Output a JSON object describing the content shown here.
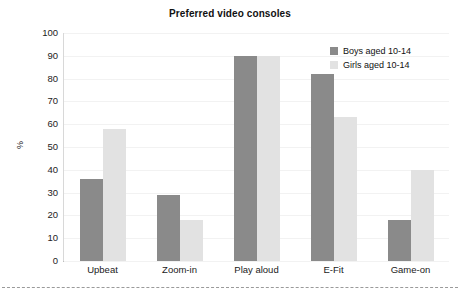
{
  "chart_data": {
    "type": "bar",
    "title": "Preferred video consoles",
    "xlabel": "",
    "ylabel": "%",
    "ylim": [
      0,
      100
    ],
    "ytick_step": 10,
    "yticks": [
      100,
      90,
      80,
      70,
      60,
      50,
      40,
      30,
      20,
      10,
      0
    ],
    "grid": true,
    "legend_position": "top-right",
    "categories": [
      "Upbeat",
      "Zoom-in",
      "Play aloud",
      "E-Fit",
      "Game-on"
    ],
    "series": [
      {
        "name": "Boys aged 10-14",
        "color": "#8a8a8a",
        "values": [
          36,
          29,
          90,
          82,
          18
        ]
      },
      {
        "name": "Girls aged 10-14",
        "color": "#e2e2e2",
        "values": [
          58,
          18,
          90,
          63,
          40
        ]
      }
    ]
  },
  "axis": {
    "y_title": "%"
  }
}
